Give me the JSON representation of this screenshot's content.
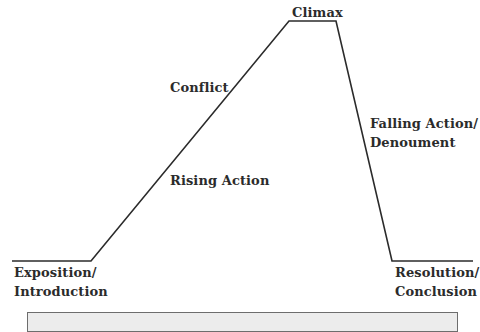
{
  "diagram": {
    "type": "plot-structure",
    "path_points": [
      [
        12,
        261
      ],
      [
        91,
        261
      ],
      [
        289,
        21
      ],
      [
        336,
        21
      ],
      [
        392,
        261
      ],
      [
        473,
        261
      ]
    ],
    "line_color": "#2b2b2b",
    "labels": {
      "climax": "Climax",
      "conflict": "Conflict",
      "rising_action": "Rising Action",
      "falling_action_line1": "Falling Action/",
      "falling_action_line2": "Denoument",
      "exposition_line1": "Exposition/",
      "exposition_line2": "Introduction",
      "resolution_line1": "Resolution/",
      "resolution_line2": "Conclusion"
    },
    "caption": {
      "text": ""
    }
  }
}
